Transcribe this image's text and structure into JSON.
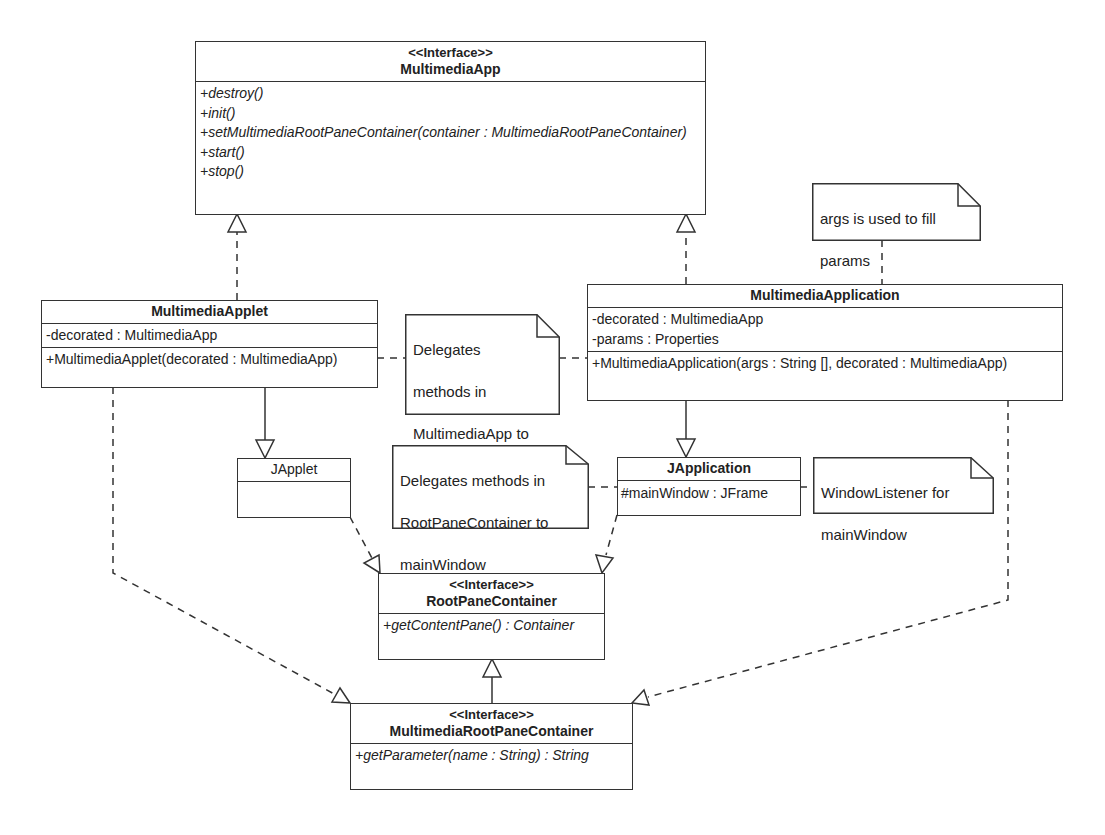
{
  "diagram": {
    "type": "UML class diagram",
    "classes": {
      "multimedia_app": {
        "stereotype": "<<Interface>>",
        "name": "MultimediaApp",
        "attributes": [],
        "operations": [
          "+destroy()",
          "+init()",
          "+setMultimediaRootPaneContainer(container : MultimediaRootPaneContainer)",
          "+start()",
          "+stop()"
        ]
      },
      "multimedia_applet": {
        "name": "MultimediaApplet",
        "attributes": [
          "-decorated : MultimediaApp"
        ],
        "operations": [
          "+MultimediaApplet(decorated : MultimediaApp)"
        ]
      },
      "multimedia_application": {
        "name": "MultimediaApplication",
        "attributes": [
          "-decorated : MultimediaApp",
          "-params : Properties"
        ],
        "operations": [
          "+MultimediaApplication(args : String [], decorated : MultimediaApp)"
        ]
      },
      "japplet": {
        "name": "JApplet",
        "attributes": [],
        "operations": []
      },
      "japplication": {
        "name": "JApplication",
        "attributes": [
          "#mainWindow : JFrame"
        ],
        "operations": []
      },
      "root_pane_container": {
        "stereotype": "<<Interface>>",
        "name": "RootPaneContainer",
        "operations": [
          "+getContentPane() : Container"
        ]
      },
      "multimedia_root_pane_container": {
        "stereotype": "<<Interface>>",
        "name": "MultimediaRootPaneContainer",
        "operations": [
          "+getParameter(name : String) : String"
        ]
      }
    },
    "notes": {
      "args_note": "args is used to fill params",
      "delegates_app_note": "Delegates methods in MultimediaApp to decorated",
      "delegates_rpc_note": "Delegates methods in RootPaneContainer to mainWindow",
      "window_listener_note": "WindowListener for mainWindow"
    },
    "notes_lines": {
      "args_note": [
        "args is used to fill",
        "params"
      ],
      "delegates_app_note": [
        "Delegates",
        "methods in",
        "MultimediaApp to",
        "decorated"
      ],
      "delegates_rpc_note": [
        "Delegates methods in",
        "RootPaneContainer to",
        "mainWindow"
      ],
      "window_listener_note": [
        "WindowListener for",
        "mainWindow"
      ]
    },
    "relationships": [
      {
        "from": "MultimediaApplet",
        "to": "MultimediaApp",
        "kind": "realization"
      },
      {
        "from": "MultimediaApplication",
        "to": "MultimediaApp",
        "kind": "realization"
      },
      {
        "from": "MultimediaApplet",
        "to": "JApplet",
        "kind": "generalization"
      },
      {
        "from": "MultimediaApplication",
        "to": "JApplication",
        "kind": "generalization"
      },
      {
        "from": "JApplet",
        "to": "RootPaneContainer",
        "kind": "realization"
      },
      {
        "from": "JApplication",
        "to": "RootPaneContainer",
        "kind": "realization"
      },
      {
        "from": "MultimediaRootPaneContainer",
        "to": "RootPaneContainer",
        "kind": "generalization"
      },
      {
        "from": "MultimediaApplet",
        "to": "MultimediaRootPaneContainer",
        "kind": "realization"
      },
      {
        "from": "MultimediaApplication",
        "to": "MultimediaRootPaneContainer",
        "kind": "realization"
      }
    ],
    "colors": {
      "line": "#333333",
      "background": "#ffffff",
      "text": "#222222"
    }
  }
}
